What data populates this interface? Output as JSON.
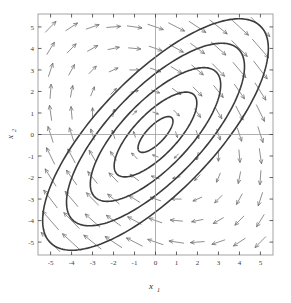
{
  "figure": {
    "kind": "phase-portrait",
    "background": "#ffffff",
    "frame_color": "#9a9a9a",
    "axis_line_color": "#9a9a9a",
    "contour_color": "#3c3c3c",
    "arrow_color": "#6a6a6a",
    "tick_color": "#3a3a3a"
  },
  "axes": {
    "x_label": "x",
    "x_label_sub": "1",
    "y_label": "x",
    "y_label_sub": "2",
    "x_ticks": [
      "-5",
      "-4",
      "-3",
      "-2",
      "-1",
      "0",
      "1",
      "2",
      "3",
      "4",
      "5"
    ],
    "y_ticks": [
      "-5",
      "-4",
      "-3",
      "-2",
      "-1",
      "0",
      "1",
      "2",
      "3",
      "4",
      "5"
    ]
  },
  "chart_data": {
    "type": "line",
    "title": "",
    "xlabel": "x1",
    "ylabel": "x2",
    "xlim": [
      -5.6,
      5.6
    ],
    "ylim": [
      -5.6,
      5.6
    ],
    "grid": false,
    "legend": "none",
    "x_ticks": [
      -5,
      -4,
      -3,
      -2,
      -1,
      0,
      1,
      2,
      3,
      4,
      5
    ],
    "y_ticks": [
      -5,
      -4,
      -3,
      -2,
      -1,
      0,
      1,
      2,
      3,
      4,
      5
    ],
    "equilibrium": {
      "x": 0,
      "y": 0,
      "type": "center"
    },
    "rotation_direction": "clockwise",
    "ellipse_rotation_deg": 45,
    "ellipse_axis_ratio": 2.6,
    "orbits_semi_major": [
      1.1,
      2.6,
      4.1,
      5.6,
      7.1
    ],
    "quiver": {
      "grid_x": [
        -5,
        -4,
        -3,
        -2,
        -1,
        0,
        1,
        2,
        3,
        4,
        5
      ],
      "grid_y": [
        -5,
        -4,
        -3,
        -2,
        -1,
        0,
        1,
        2,
        3,
        4,
        5
      ],
      "field": "dx1/dt proportional to (x1 + 3*x2), dx2/dt proportional to -(3*x1 + x2)",
      "arrow_count": 121
    },
    "series": [
      {
        "name": "orbit-1",
        "semi_major": 1.1,
        "semi_minor": 0.42
      },
      {
        "name": "orbit-2",
        "semi_major": 2.6,
        "semi_minor": 1.0
      },
      {
        "name": "orbit-3",
        "semi_major": 4.1,
        "semi_minor": 1.58
      },
      {
        "name": "orbit-4",
        "semi_major": 5.6,
        "semi_minor": 2.15
      },
      {
        "name": "orbit-5",
        "semi_major": 7.1,
        "semi_minor": 2.73
      }
    ]
  }
}
